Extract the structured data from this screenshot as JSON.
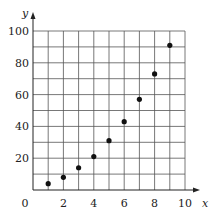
{
  "chart_data": {
    "type": "scatter",
    "title": "",
    "xlabel": "x",
    "ylabel": "y",
    "xlim": [
      0,
      10
    ],
    "ylim": [
      0,
      100
    ],
    "x_ticks": [
      0,
      2,
      4,
      6,
      8,
      10
    ],
    "y_ticks": [
      20,
      40,
      60,
      80,
      100
    ],
    "x_tick_labels": [
      "0",
      "2",
      "4",
      "6",
      "8",
      "10"
    ],
    "y_tick_labels": [
      "20",
      "40",
      "60",
      "80",
      "100"
    ],
    "grid": true,
    "grid_x_step": 1,
    "grid_y_step": 10,
    "legend": null,
    "series": [
      {
        "name": "data",
        "x": [
          1,
          2,
          3,
          4,
          5,
          6,
          7,
          8,
          9
        ],
        "y": [
          4,
          8,
          14,
          21,
          31,
          43,
          57,
          73,
          91
        ]
      }
    ]
  },
  "colors": {
    "points": "#111111",
    "grid": "#555555",
    "axis": "#222222",
    "background": "#ffffff"
  }
}
